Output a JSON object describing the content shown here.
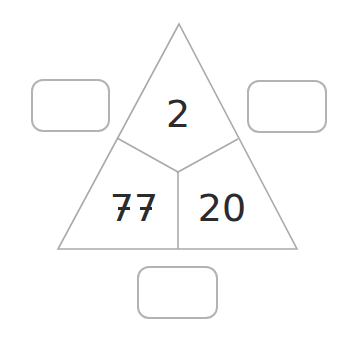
{
  "diagram": {
    "type": "number-triangle",
    "top_value": "2",
    "bottom_left_value": "77",
    "bottom_right_value": "20",
    "answer_boxes": [
      {
        "position": "left",
        "value": ""
      },
      {
        "position": "right",
        "value": ""
      },
      {
        "position": "bottom",
        "value": ""
      }
    ],
    "colors": {
      "line": "#aaaaaa",
      "text": "#2b2b2b",
      "box_border": "#b3b3b3",
      "background": "#ffffff"
    }
  }
}
